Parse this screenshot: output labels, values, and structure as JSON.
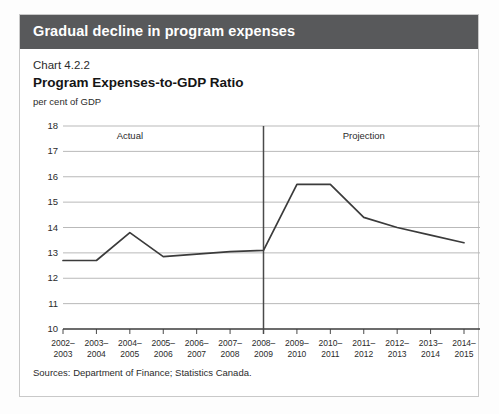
{
  "header": {
    "banner_title": "Gradual decline in program expenses",
    "banner_color": "#58595b"
  },
  "chart_heading": {
    "chart_number": "Chart 4.2.2",
    "title": "Program Expenses-to-GDP Ratio",
    "unit_label": "per cent of GDP"
  },
  "footer": {
    "sources": "Sources: Department of Finance; Statistics Canada."
  },
  "chart_data": {
    "type": "line",
    "title": "Program Expenses-to-GDP Ratio",
    "subtitle": "Chart 4.2.2",
    "xlabel": "",
    "ylabel": "per cent of GDP",
    "ylim": [
      10,
      18
    ],
    "yticks": [
      10,
      11,
      12,
      13,
      14,
      15,
      16,
      17,
      18
    ],
    "ytick_labels": [
      "10",
      "11",
      "12",
      "13",
      "14",
      "15",
      "16",
      "17",
      "18"
    ],
    "grid": true,
    "legend": "none",
    "line_color": "#3b3b3b",
    "categories": [
      "2002-2003",
      "2003-2004",
      "2004-2005",
      "2005-2006",
      "2006-2007",
      "2007-2008",
      "2008-2009",
      "2009-2010",
      "2010-2011",
      "2011-2012",
      "2012-2013",
      "2013-2014",
      "2014-2015"
    ],
    "xtick_labels": [
      [
        "2002–",
        "2003"
      ],
      [
        "2003–",
        "2004"
      ],
      [
        "2004–",
        "2005"
      ],
      [
        "2005–",
        "2006"
      ],
      [
        "2006–",
        "2007"
      ],
      [
        "2007–",
        "2008"
      ],
      [
        "2008–",
        "2009"
      ],
      [
        "2009–",
        "2010"
      ],
      [
        "2010–",
        "2011"
      ],
      [
        "2011–",
        "2012"
      ],
      [
        "2012–",
        "2013"
      ],
      [
        "2013–",
        "2014"
      ],
      [
        "2014–",
        "2015"
      ]
    ],
    "values": [
      12.7,
      12.7,
      13.8,
      12.85,
      12.95,
      13.05,
      13.1,
      15.7,
      15.7,
      14.4,
      14.0,
      13.7,
      13.4
    ],
    "annotations": [
      {
        "text": "Actual",
        "at_category": "2004-2005",
        "y": 17.6
      },
      {
        "text": "Projection",
        "at_category": "2011-2012",
        "y": 17.6
      }
    ],
    "divider": {
      "at_category": "2008-2009",
      "label_left": "Actual",
      "label_right": "Projection"
    }
  }
}
